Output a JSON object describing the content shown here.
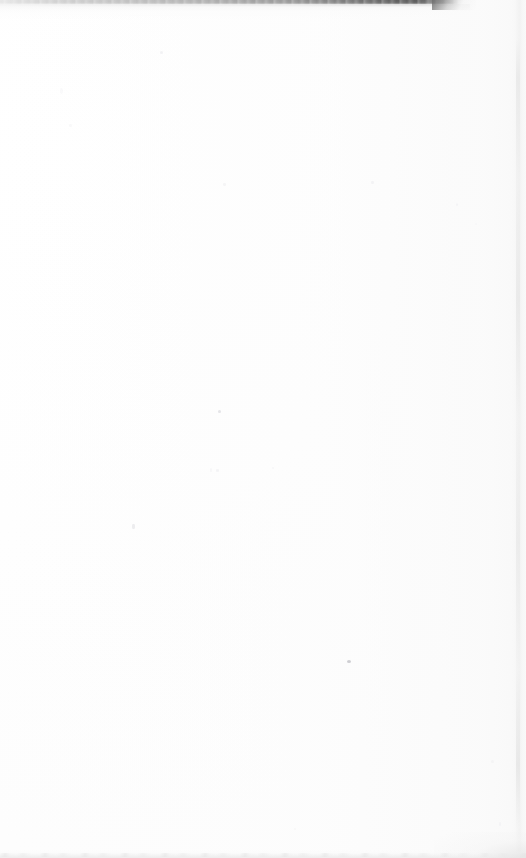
{
  "page": {
    "kind": "scanned-blank-leaf",
    "width_px": 526,
    "height_px": 858,
    "background_color": "#ffffff",
    "paper_tone_color": "#fdfdfd",
    "body_text": "",
    "has_visible_text": false
  },
  "scan_artifacts": {
    "top_edge": {
      "label": "top-scan-edge",
      "color": "#5c5c5c",
      "light_color": "#e2e2e2",
      "x_start_px": 0,
      "x_end_px": 458,
      "thickness_px": 5,
      "darkest_x_px": 420,
      "note": "Dark scanner lid / page edge line across the upper margin, fading to the left and tapering away to the right"
    },
    "right_edge": {
      "label": "right-scan-edge",
      "color": "#ebebeb",
      "x_px": 518,
      "width_px": 4,
      "note": "Faint vertical paper border band near the right margin"
    },
    "bottom_edge": {
      "label": "bottom-scan-edge",
      "color": "#ebebeb",
      "y_px": 854,
      "thickness_px": 4,
      "note": "Faint gray smudge line along the bottom margin, slightly darker at the right corner"
    },
    "dust_specks": {
      "label": "dust-specks",
      "count": 16,
      "primary_color": "#b2b2b8",
      "note": "Scattered scanner dust flecks; the most visible sits near the lower middle of the page"
    }
  }
}
